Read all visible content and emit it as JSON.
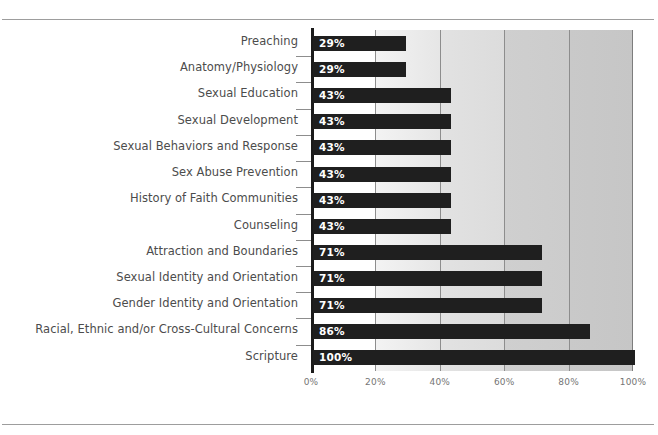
{
  "page": {
    "top_partial_text": "",
    "background_color": "#ffffff",
    "rule_color": "#9d9d9d"
  },
  "chart_data": {
    "type": "bar",
    "orientation": "horizontal",
    "title": "",
    "subtitle": "",
    "xlabel": "",
    "ylabel": "",
    "xlim": [
      0,
      100
    ],
    "grid": true,
    "legend": false,
    "legend_position": "none",
    "value_suffix": "%",
    "bar_color": "#1f1f1f",
    "value_label_color": "#ffffff",
    "axis_line_color": "#1b1b1b",
    "gridline_color": "#8d8d8d",
    "band_colors": [
      "#ffffff",
      "#ededed",
      "#dfdfdf",
      "#cecece",
      "#c7c7c7"
    ],
    "xticks": [
      "0%",
      "20%",
      "40%",
      "60%",
      "80%",
      "100%"
    ],
    "xtick_values": [
      0,
      20,
      40,
      60,
      80,
      100
    ],
    "categories": [
      "Preaching",
      "Anatomy/Physiology",
      "Sexual Education",
      "Sexual Development",
      "Sexual Behaviors and Response",
      "Sex Abuse Prevention",
      "History of Faith Communities",
      "Counseling",
      "Attraction and Boundaries",
      "Sexual Identity and Orientation",
      "Gender Identity and Orientation",
      "Racial, Ethnic and/or Cross-Cultural Concerns",
      "Scripture"
    ],
    "values": [
      29,
      29,
      43,
      43,
      43,
      43,
      43,
      43,
      71,
      71,
      71,
      86,
      100
    ],
    "value_labels": [
      "29%",
      "29%",
      "43%",
      "43%",
      "43%",
      "43%",
      "43%",
      "43%",
      "71%",
      "71%",
      "71%",
      "86%",
      "100%"
    ]
  }
}
